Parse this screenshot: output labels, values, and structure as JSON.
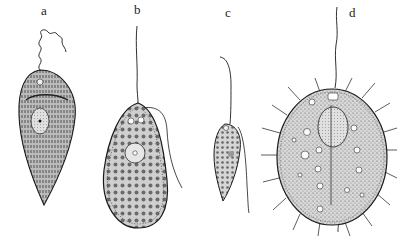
{
  "figure": {
    "background": "#ffffff",
    "ink": "#1a1a1a",
    "panels": [
      {
        "label": "a",
        "name": "organism-a",
        "label_pos": [
          41,
          3
        ]
      },
      {
        "label": "b",
        "name": "organism-b",
        "label_pos": [
          134,
          2
        ]
      },
      {
        "label": "c",
        "name": "organism-c",
        "label_pos": [
          225,
          5
        ]
      },
      {
        "label": "d",
        "name": "organism-d",
        "label_pos": [
          349,
          5
        ]
      }
    ]
  }
}
